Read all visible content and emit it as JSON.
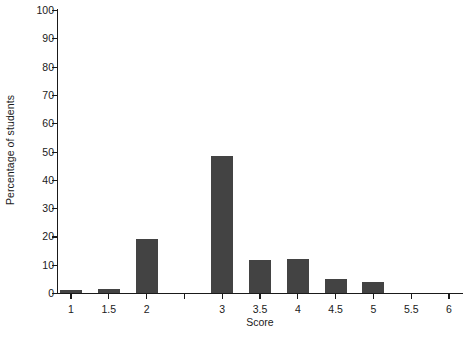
{
  "chart_data": {
    "type": "bar",
    "title": "",
    "xlabel": "Score",
    "ylabel": "Percentage of students",
    "categories": [
      "1",
      "1.5",
      "2",
      "2.5",
      "3",
      "3.5",
      "4",
      "4.5",
      "5",
      "5.5",
      "6"
    ],
    "values": [
      1,
      1.5,
      19,
      0,
      48.5,
      11.5,
      12,
      5,
      4,
      0,
      0
    ],
    "xlim": [
      0.75,
      6.25
    ],
    "ylim": [
      0,
      100
    ],
    "ytick_labels": [
      "0",
      "10",
      "20",
      "30",
      "40",
      "50",
      "60",
      "70",
      "80",
      "90",
      "100"
    ],
    "ytick_values": [
      0,
      10,
      20,
      30,
      40,
      50,
      60,
      70,
      80,
      90,
      100
    ],
    "xtick_labels": [
      "1",
      "1.5",
      "2",
      "",
      "3",
      "3.5",
      "4",
      "4.5",
      "5",
      "5.5",
      "6"
    ],
    "grid": false,
    "legend": null,
    "bar_color": "#434343",
    "axis_color": "#1a1a1a",
    "background_color": "#ffffff"
  }
}
